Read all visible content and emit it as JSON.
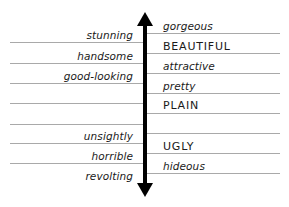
{
  "diagram": {
    "title": "",
    "axis": {
      "top_direction": "more attractive",
      "bottom_direction": "less attractive"
    },
    "left_words": [
      {
        "text": "stunning"
      },
      {
        "text": "handsome"
      },
      {
        "text": "good-looking"
      },
      {
        "text": ""
      },
      {
        "text": ""
      },
      {
        "text": "unsightly"
      },
      {
        "text": "horrible"
      },
      {
        "text": "revolting"
      }
    ],
    "right_words": [
      {
        "text": "gorgeous"
      },
      {
        "text": "BEAUTIFUL"
      },
      {
        "text": "attractive"
      },
      {
        "text": "pretty"
      },
      {
        "text": "PLAIN"
      },
      {
        "text": ""
      },
      {
        "text": "UGLY"
      },
      {
        "text": "hideous"
      }
    ],
    "colors": {
      "rule": "#a9a9a9",
      "ink": "#000000",
      "background": "#ffffff"
    }
  }
}
